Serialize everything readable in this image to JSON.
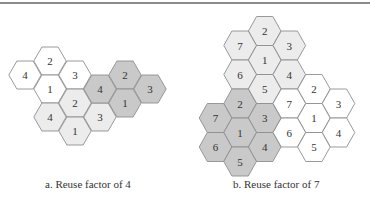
{
  "colors": {
    "white": "#ffffff",
    "light": "#ececec",
    "dark": "#c9c9c9",
    "stroke": "#8f8f8f"
  },
  "diagrams": [
    {
      "id": "a",
      "caption": "a. Reuse factor of 4",
      "reuse_factor": 4,
      "clusters": [
        {
          "shade": "white",
          "cells": [
            {
              "col": 0,
              "row": 0,
              "label": "4"
            },
            {
              "col": 1,
              "row": -1,
              "label": "2"
            },
            {
              "col": 1,
              "row": 1,
              "label": "1"
            },
            {
              "col": 2,
              "row": 0,
              "label": "3"
            }
          ]
        },
        {
          "shade": "light",
          "cells": [
            {
              "col": 1,
              "row": 3,
              "label": "4"
            },
            {
              "col": 2,
              "row": 2,
              "label": "2"
            },
            {
              "col": 2,
              "row": 4,
              "label": "1"
            },
            {
              "col": 3,
              "row": 3,
              "label": "3"
            }
          ]
        },
        {
          "shade": "dark",
          "cells": [
            {
              "col": 3,
              "row": 1,
              "label": "4"
            },
            {
              "col": 4,
              "row": 0,
              "label": "2"
            },
            {
              "col": 4,
              "row": 2,
              "label": "1"
            },
            {
              "col": 5,
              "row": 1,
              "label": "3"
            }
          ]
        }
      ]
    },
    {
      "id": "b",
      "caption": "b. Reuse factor of 7",
      "reuse_factor": 7,
      "clusters": [
        {
          "shade": "light",
          "cells": [
            {
              "col": 2,
              "row": 0,
              "label": "2"
            },
            {
              "col": 1,
              "row": 1,
              "label": "7"
            },
            {
              "col": 3,
              "row": 1,
              "label": "3"
            },
            {
              "col": 2,
              "row": 2,
              "label": "1"
            },
            {
              "col": 1,
              "row": 3,
              "label": "6"
            },
            {
              "col": 3,
              "row": 3,
              "label": "4"
            },
            {
              "col": 2,
              "row": 4,
              "label": "5"
            }
          ]
        },
        {
          "shade": "white",
          "cells": [
            {
              "col": 4,
              "row": 4,
              "label": "2"
            },
            {
              "col": 3,
              "row": 5,
              "label": "7"
            },
            {
              "col": 5,
              "row": 5,
              "label": "3"
            },
            {
              "col": 4,
              "row": 6,
              "label": "1"
            },
            {
              "col": 3,
              "row": 7,
              "label": "6"
            },
            {
              "col": 5,
              "row": 7,
              "label": "4"
            },
            {
              "col": 4,
              "row": 8,
              "label": "5"
            }
          ]
        },
        {
          "shade": "dark",
          "cells": [
            {
              "col": 1,
              "row": 5,
              "label": "2"
            },
            {
              "col": 0,
              "row": 6,
              "label": "7"
            },
            {
              "col": 2,
              "row": 6,
              "label": "3"
            },
            {
              "col": 1,
              "row": 7,
              "label": "1"
            },
            {
              "col": 0,
              "row": 8,
              "label": "6"
            },
            {
              "col": 2,
              "row": 8,
              "label": "4"
            },
            {
              "col": 1,
              "row": 9,
              "label": "5"
            }
          ]
        }
      ]
    }
  ]
}
